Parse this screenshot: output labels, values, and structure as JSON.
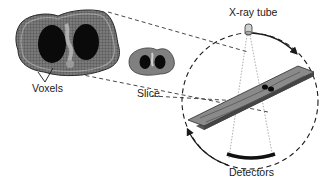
{
  "diagram": {
    "labels": {
      "voxels": "Voxels",
      "slice": "Slice",
      "xray_tube": "X-ray tube",
      "detectors": "Detectors"
    },
    "components": [
      {
        "id": "voxel-grid",
        "label": "Voxels",
        "description": "Enlarged axial chest cross-section overlaid with voxel grid"
      },
      {
        "id": "slice",
        "label": "Slice",
        "description": "Small axial chest cross-section image"
      },
      {
        "id": "gantry",
        "label": "",
        "description": "Dashed circular gantry path with rotation arrows"
      },
      {
        "id": "xray-tube",
        "label": "X-ray tube",
        "description": "Tube at top of gantry emitting fan beam"
      },
      {
        "id": "patient-table",
        "label": "",
        "description": "Patient lying on table passing through gantry"
      },
      {
        "id": "detectors",
        "label": "Detectors",
        "description": "Curved detector array opposite the tube"
      }
    ],
    "colors": {
      "outline": "#1a1a1a",
      "tissue": "#8a8a8a",
      "lung": "#0a0a0a",
      "table": "#7d7d7d"
    }
  }
}
